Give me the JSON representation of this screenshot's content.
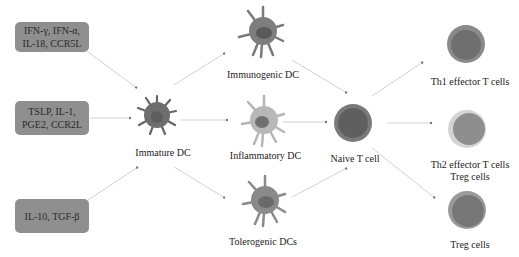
{
  "diagram": {
    "title": "",
    "stimuli": [
      {
        "id": "stim1",
        "lines": [
          "IFN-γ, IFN-α,",
          "IL-18, CCR5L"
        ]
      },
      {
        "id": "stim2",
        "lines": [
          "TSLP, IL-1,",
          "PGE2, CCR2L"
        ]
      },
      {
        "id": "stim3",
        "lines": [
          "IL-10, TGF-β"
        ]
      }
    ],
    "nodes": {
      "immature_dc": "Immature DC",
      "immunogenic_dc": "Immunogenic DC",
      "inflammatory_dc": "Inflammatory DC",
      "tolerogenic_dc": "Tolerogenic DCs",
      "naive_t": "Naive T cell",
      "th1": "Th1  effector T cells",
      "th2_line1": "Th2 effector T cells",
      "th2_line2": "Treg cells",
      "treg": "Treg cells"
    },
    "edges": [
      {
        "from": "stim1",
        "to": "immature_dc"
      },
      {
        "from": "stim2",
        "to": "immature_dc"
      },
      {
        "from": "stim3",
        "to": "immature_dc"
      },
      {
        "from": "immature_dc",
        "to": "immunogenic_dc"
      },
      {
        "from": "immature_dc",
        "to": "inflammatory_dc"
      },
      {
        "from": "immature_dc",
        "to": "tolerogenic_dc"
      },
      {
        "from": "immunogenic_dc",
        "to": "naive_t"
      },
      {
        "from": "inflammatory_dc",
        "to": "naive_t"
      },
      {
        "from": "tolerogenic_dc",
        "to": "naive_t"
      },
      {
        "from": "naive_t",
        "to": "th1"
      },
      {
        "from": "naive_t",
        "to": "th2"
      },
      {
        "from": "naive_t",
        "to": "treg"
      }
    ],
    "colors": {
      "box": "#8f8f8f",
      "arrow": "#cfcfcf",
      "dc_dark": "#6e6e6e",
      "dc_light": "#b8b8b8",
      "nucleus": "#5a5a5a"
    }
  }
}
